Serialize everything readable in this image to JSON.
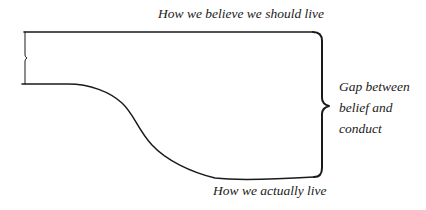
{
  "diagram": {
    "title": "Gap between belief and conduct",
    "labels": {
      "ideal": "How we believe we should live",
      "actual": "How we actually live",
      "gap": [
        "Gap between",
        "belief and",
        "conduct"
      ]
    },
    "colors": {
      "stroke": "#1a1a1a",
      "text": "#1a1a1a",
      "background": "#ffffff"
    }
  }
}
